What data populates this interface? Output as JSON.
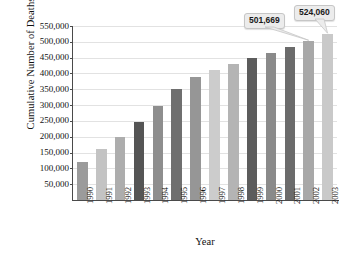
{
  "chart_data": {
    "type": "bar",
    "title": "",
    "xlabel": "Year",
    "ylabel": "Cumulative Number of Deaths",
    "categories": [
      "1990",
      "1991",
      "1992",
      "1993",
      "1994",
      "1995",
      "1996",
      "1997",
      "1998",
      "1999",
      "2000",
      "2001",
      "2002",
      "2003"
    ],
    "values": [
      120000,
      160000,
      200000,
      248000,
      298000,
      350000,
      389000,
      412000,
      431000,
      449000,
      466000,
      483000,
      501669,
      524060
    ],
    "ylim": [
      0,
      550000
    ],
    "ytick_labels": [
      "550,000",
      "500,000",
      "450,000",
      "400,000",
      "350,000",
      "300,000",
      "250,000",
      "200,000",
      "150,000",
      "100,000",
      "50,000"
    ],
    "ytick_values": [
      550000,
      500000,
      450000,
      400000,
      350000,
      300000,
      250000,
      200000,
      150000,
      100000,
      50000
    ],
    "grid": true,
    "legend": false,
    "bar_colors": [
      "#9b9b9b",
      "#c3c3c3",
      "#adadad",
      "#555555",
      "#8e8e8e",
      "#6f6f6f",
      "#969696",
      "#cccccc",
      "#b4b4b4",
      "#5c5c5c",
      "#8a8a8a",
      "#6b6b6b",
      "#a8a8a8",
      "#c9c9c9"
    ],
    "annotations": [
      {
        "label": "501,669",
        "category": "2002",
        "value": 501669
      },
      {
        "label": "524,060",
        "category": "2003",
        "value": 524060
      }
    ]
  },
  "colors": {
    "axis": "#4a4a4a",
    "gridline": "#e2e2e2",
    "callout_fill": "#ececec",
    "callout_border": "#c6c6c6",
    "text": "#111111",
    "background": "#ffffff"
  }
}
